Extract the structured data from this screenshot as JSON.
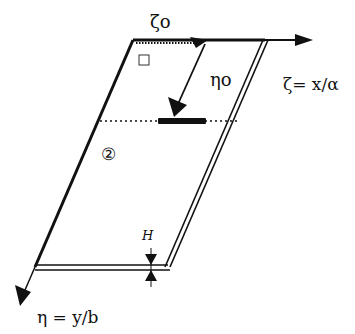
{
  "diagram": {
    "type": "skewed-plate-coordinate-diagram",
    "labels": {
      "zeta0": "ζo",
      "eta0": "ηo",
      "zeta_axis": "ζ= x/α",
      "eta_axis": "η = y/b",
      "region_marker": "②",
      "thickness": "H",
      "corner_box": "□"
    },
    "colors": {
      "ink": "#111111",
      "background": "#ffffff"
    }
  }
}
